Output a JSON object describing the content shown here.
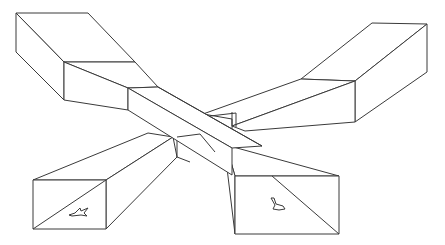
{
  "figure": {
    "line_color": "#3a3a3a",
    "background_color": "#ffffff",
    "parts": [
      {
        "name": "top-left-block"
      },
      {
        "name": "top-right-block"
      },
      {
        "name": "bottom-left-block",
        "icon": "airplane-icon"
      },
      {
        "name": "bottom-right-block",
        "icon": "airplane-icon"
      },
      {
        "name": "central-crossing-bar"
      }
    ]
  }
}
